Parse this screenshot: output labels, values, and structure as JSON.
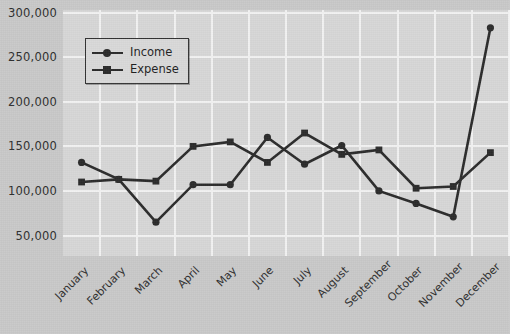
{
  "chart_data": {
    "type": "line",
    "title": "",
    "subtitle": "",
    "xlabel": "",
    "ylabel": "",
    "categories": [
      "January",
      "February",
      "March",
      "April",
      "May",
      "June",
      "July",
      "August",
      "September",
      "October",
      "November",
      "December"
    ],
    "series": [
      {
        "name": "Income",
        "marker": "circle",
        "color": "#2b2b2b",
        "values": [
          132000,
          113000,
          65000,
          107000,
          107000,
          160000,
          130000,
          151000,
          100000,
          86000,
          71000,
          283000
        ]
      },
      {
        "name": "Expense",
        "marker": "square",
        "color": "#2b2b2b",
        "values": [
          110000,
          113000,
          111000,
          150000,
          155000,
          132000,
          165000,
          141000,
          146000,
          103000,
          105000,
          143000
        ]
      }
    ],
    "ylim": [
      27000,
      303000
    ],
    "yticks": [
      50000,
      100000,
      150000,
      200000,
      250000,
      300000
    ],
    "ytick_labels": [
      "50,000",
      "100,000",
      "150,000",
      "200,000",
      "250,000",
      "300,000"
    ],
    "grid": true,
    "grid_color": "#f2f2f2",
    "legend_position": "upper-left",
    "plot_background": "#d7d7d7",
    "figure_background": "#c9c9c9",
    "xtick_rotation": -45
  },
  "legend": {
    "items": [
      {
        "label": "Income",
        "marker": "circle"
      },
      {
        "label": "Expense",
        "marker": "square"
      }
    ]
  }
}
